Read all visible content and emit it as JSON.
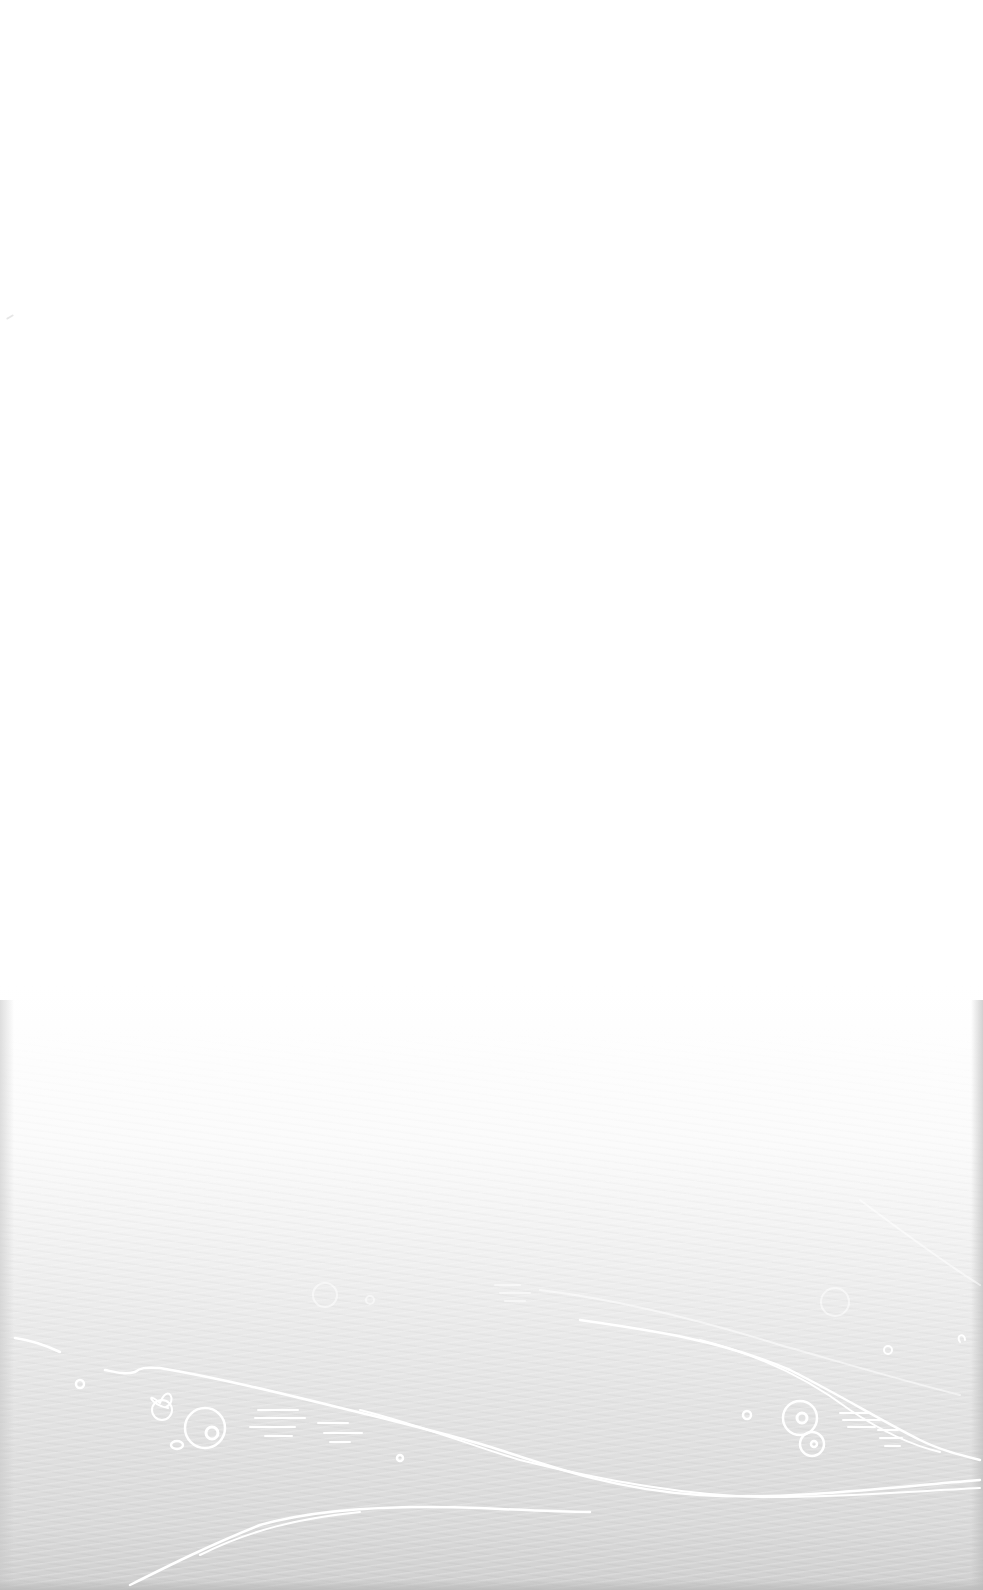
{
  "screen": {
    "type": "blank-background",
    "theme": {
      "top_color": "#ffffff",
      "bottom_color": "#cfcfcf",
      "doodle_color": "#ffffff"
    },
    "decorations": [
      "wave-lines",
      "bubble-circles",
      "dash-marks"
    ]
  }
}
